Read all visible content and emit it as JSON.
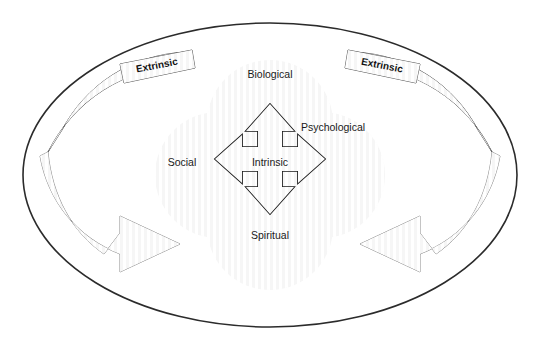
{
  "diagram": {
    "background_color": "#ffffff",
    "outer_boundary": {
      "name": "outer-ellipse",
      "stroke_color": "#2b2b2b",
      "fill_color": "none",
      "cx": 270,
      "cy": 175,
      "rx": 247,
      "ry": 152
    },
    "domains": [
      {
        "id": "biological",
        "label": "Biological",
        "position": "top",
        "cx": 270,
        "cy": 123,
        "r": 63,
        "fill_color": "#c9c9c9",
        "label_x": 270,
        "label_y": 75
      },
      {
        "id": "psychological",
        "label": "Psychological",
        "position": "right",
        "cx": 322,
        "cy": 175,
        "r": 63,
        "fill_color": "#c9c9c9",
        "label_x": 333,
        "label_y": 128
      },
      {
        "id": "spiritual",
        "label": "Spiritual",
        "position": "bottom",
        "cx": 270,
        "cy": 227,
        "r": 63,
        "fill_color": "#c9c9c9",
        "label_x": 270,
        "label_y": 236
      },
      {
        "id": "social",
        "label": "Social",
        "position": "left",
        "cx": 218,
        "cy": 175,
        "r": 63,
        "fill_color": "#c9c9c9",
        "label_x": 182,
        "label_y": 163
      }
    ],
    "overlap_color": "#9e9e9e",
    "petal_outline_color": "#ffffff",
    "center": {
      "id": "intrinsic",
      "label": "Intrinsic",
      "label_x": 270,
      "label_y": 163,
      "arrow_name": "four-way-arrow",
      "arrow_fill": "#9a9a9a",
      "arrow_stroke": "#1a1a1a",
      "directions": [
        "up",
        "right",
        "down",
        "left"
      ]
    },
    "bands": [
      {
        "id": "extrinsic-left",
        "label": "Extrinsic",
        "side": "left",
        "fill_color": "#9b9b9b",
        "stroke_color": "#555555",
        "label_x": 157,
        "label_y": 75
      },
      {
        "id": "extrinsic-right",
        "label": "Extrinsic",
        "side": "right",
        "fill_color": "#9b9b9b",
        "stroke_color": "#555555",
        "label_x": 382,
        "label_y": 73
      }
    ],
    "curved_arrows": [
      {
        "id": "arrow-left-sweep",
        "direction": "clockwise-inward-right",
        "fill_color": "#d9d9d9",
        "stroke_color": "#8a8a8a"
      },
      {
        "id": "arrow-right-sweep",
        "direction": "counterclockwise-inward-left",
        "fill_color": "#d9d9d9",
        "stroke_color": "#8a8a8a"
      }
    ]
  }
}
